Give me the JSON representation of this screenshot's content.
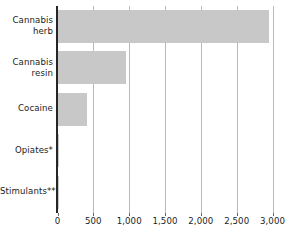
{
  "chart_data": {
    "type": "bar",
    "orientation": "horizontal",
    "title": "",
    "subtitle": "",
    "xlabel": "",
    "ylabel": "",
    "categories": [
      "Cannabis herb",
      "Cannabis resin",
      "Cocaine",
      "Opiates*",
      "Stimulants**"
    ],
    "category_lines": [
      [
        "Cannabis",
        "herb"
      ],
      [
        "Cannabis",
        "resin"
      ],
      [
        "Cocaine"
      ],
      [
        "Opiates*"
      ],
      [
        "Stimulants**"
      ]
    ],
    "values": [
      2950,
      955,
      405,
      8,
      5
    ],
    "series": [
      {
        "name": "Seizures",
        "values": [
          2950,
          955,
          405,
          8,
          5
        ]
      }
    ],
    "xlim": [
      0,
      3000
    ],
    "ylim": null,
    "xticks": [
      0,
      500,
      1000,
      1500,
      2000,
      2500,
      3000
    ],
    "xtick_labels": [
      "0",
      "500",
      "1,000",
      "1,500",
      "2,000",
      "2,500",
      "3,000"
    ],
    "grid": "vertical",
    "legend": null,
    "legend_position": "none",
    "annotations": [],
    "footnotes": [
      "*",
      "**"
    ],
    "colors": {
      "bar_fill": "#c8c8c8",
      "gridline": "#b9b9b9",
      "axis": "#262626",
      "text": "#1c1c1c",
      "background": "#ffffff"
    }
  }
}
